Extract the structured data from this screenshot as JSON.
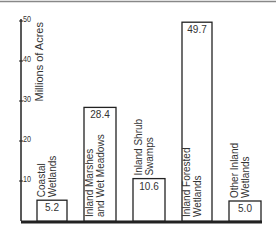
{
  "chart_data": {
    "type": "bar",
    "title": "",
    "xlabel": "",
    "ylabel": "Millions of Acres",
    "ylim": [
      0,
      50
    ],
    "yticks": [
      10,
      20,
      30,
      40,
      50
    ],
    "ytick_labels": [
      "10",
      "20",
      "30",
      "40",
      "50"
    ],
    "grid": false,
    "legend": "none",
    "categories": [
      [
        "Coastal",
        "Wetlands"
      ],
      [
        "Inland Marshes",
        "and Wet Meadows"
      ],
      [
        "Inland Shrub",
        "Swamps"
      ],
      [
        "Inland Forested",
        "Wetlands"
      ],
      [
        "Other Inland",
        "Wetlands"
      ]
    ],
    "values": [
      5.2,
      28.4,
      10.6,
      49.7,
      5.0
    ],
    "value_labels": [
      "5.2",
      "28.4",
      "10.6",
      "49.7",
      "5.0"
    ],
    "colors": {
      "bar_fill": "#ffffff",
      "bar_stroke": "#222222",
      "axis": "#222222",
      "text": "#333333"
    }
  }
}
